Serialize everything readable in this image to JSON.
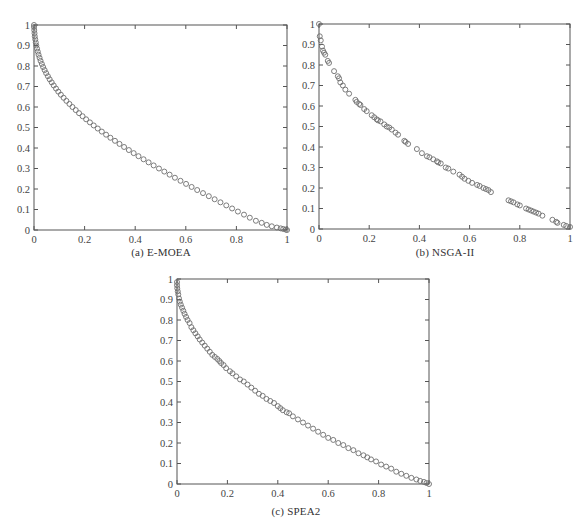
{
  "figure": {
    "panels": [
      {
        "id": "a",
        "caption": "(a) E-MOEA"
      },
      {
        "id": "b",
        "caption": "(b) NSGA-II"
      },
      {
        "id": "c",
        "caption": "(c) SPEA2"
      }
    ]
  },
  "style": {
    "marker_color": "#6e6e6e",
    "axis_color": "#555555",
    "marker": "hollow-circle"
  },
  "chart_data": [
    {
      "type": "scatter",
      "title": "(a) E-MOEA",
      "xlabel": "",
      "ylabel": "",
      "xlim": [
        0,
        1
      ],
      "ylim": [
        0,
        1
      ],
      "xticks": [
        "0",
        "0.2",
        "0.4",
        "0.6",
        "0.8",
        "1"
      ],
      "yticks": [
        "0",
        "0.1",
        "0.2",
        "0.3",
        "0.4",
        "0.5",
        "0.6",
        "0.7",
        "0.8",
        "0.9",
        "1"
      ],
      "grid": false,
      "legend": null,
      "series": [
        {
          "name": "E-MOEA",
          "points": [
            [
              0.0,
              1.0
            ],
            [
              0.0,
              0.99
            ],
            [
              0.001,
              0.975
            ],
            [
              0.002,
              0.96
            ],
            [
              0.003,
              0.945
            ],
            [
              0.005,
              0.93
            ],
            [
              0.007,
              0.915
            ],
            [
              0.009,
              0.9
            ],
            [
              0.012,
              0.885
            ],
            [
              0.015,
              0.87
            ],
            [
              0.018,
              0.855
            ],
            [
              0.022,
              0.84
            ],
            [
              0.026,
              0.825
            ],
            [
              0.031,
              0.81
            ],
            [
              0.036,
              0.795
            ],
            [
              0.042,
              0.78
            ],
            [
              0.048,
              0.765
            ],
            [
              0.055,
              0.75
            ],
            [
              0.062,
              0.735
            ],
            [
              0.07,
              0.72
            ],
            [
              0.078,
              0.705
            ],
            [
              0.087,
              0.69
            ],
            [
              0.096,
              0.675
            ],
            [
              0.106,
              0.66
            ],
            [
              0.117,
              0.645
            ],
            [
              0.128,
              0.63
            ],
            [
              0.14,
              0.615
            ],
            [
              0.152,
              0.6
            ],
            [
              0.165,
              0.585
            ],
            [
              0.178,
              0.57
            ],
            [
              0.192,
              0.555
            ],
            [
              0.206,
              0.54
            ],
            [
              0.221,
              0.525
            ],
            [
              0.236,
              0.51
            ],
            [
              0.252,
              0.495
            ],
            [
              0.268,
              0.48
            ],
            [
              0.285,
              0.465
            ],
            [
              0.302,
              0.45
            ],
            [
              0.32,
              0.435
            ],
            [
              0.338,
              0.42
            ],
            [
              0.356,
              0.405
            ],
            [
              0.375,
              0.39
            ],
            [
              0.394,
              0.375
            ],
            [
              0.413,
              0.36
            ],
            [
              0.433,
              0.345
            ],
            [
              0.453,
              0.33
            ],
            [
              0.473,
              0.315
            ],
            [
              0.494,
              0.3
            ],
            [
              0.515,
              0.285
            ],
            [
              0.536,
              0.27
            ],
            [
              0.557,
              0.255
            ],
            [
              0.579,
              0.24
            ],
            [
              0.601,
              0.225
            ],
            [
              0.623,
              0.21
            ],
            [
              0.645,
              0.195
            ],
            [
              0.668,
              0.18
            ],
            [
              0.691,
              0.165
            ],
            [
              0.714,
              0.15
            ],
            [
              0.737,
              0.135
            ],
            [
              0.76,
              0.12
            ],
            [
              0.783,
              0.105
            ],
            [
              0.806,
              0.09
            ],
            [
              0.83,
              0.075
            ],
            [
              0.853,
              0.06
            ],
            [
              0.877,
              0.045
            ],
            [
              0.9,
              0.035
            ],
            [
              0.92,
              0.025
            ],
            [
              0.94,
              0.018
            ],
            [
              0.96,
              0.012
            ],
            [
              0.975,
              0.008
            ],
            [
              0.985,
              0.005
            ],
            [
              0.995,
              0.002
            ],
            [
              1.0,
              0.0
            ]
          ]
        }
      ]
    },
    {
      "type": "scatter",
      "title": "(b) NSGA-II",
      "xlabel": "",
      "ylabel": "",
      "xlim": [
        0,
        1
      ],
      "ylim": [
        0,
        1
      ],
      "xticks": [
        "0",
        "0.2",
        "0.4",
        "0.6",
        "0.8",
        "1"
      ],
      "yticks": [
        "0",
        "0.1",
        "0.2",
        "0.3",
        "0.4",
        "0.5",
        "0.6",
        "0.7",
        "0.8",
        "0.9",
        "1"
      ],
      "grid": false,
      "legend": null,
      "series": [
        {
          "name": "NSGA-II",
          "points": [
            [
              0.0,
              1.0
            ],
            [
              0.003,
              0.94
            ],
            [
              0.007,
              0.92
            ],
            [
              0.012,
              0.89
            ],
            [
              0.016,
              0.87
            ],
            [
              0.02,
              0.86
            ],
            [
              0.025,
              0.85
            ],
            [
              0.035,
              0.82
            ],
            [
              0.04,
              0.81
            ],
            [
              0.06,
              0.77
            ],
            [
              0.075,
              0.745
            ],
            [
              0.08,
              0.735
            ],
            [
              0.085,
              0.715
            ],
            [
              0.095,
              0.7
            ],
            [
              0.105,
              0.68
            ],
            [
              0.12,
              0.66
            ],
            [
              0.145,
              0.63
            ],
            [
              0.15,
              0.62
            ],
            [
              0.16,
              0.61
            ],
            [
              0.165,
              0.605
            ],
            [
              0.18,
              0.585
            ],
            [
              0.19,
              0.575
            ],
            [
              0.21,
              0.555
            ],
            [
              0.22,
              0.545
            ],
            [
              0.23,
              0.535
            ],
            [
              0.235,
              0.53
            ],
            [
              0.245,
              0.525
            ],
            [
              0.26,
              0.51
            ],
            [
              0.27,
              0.5
            ],
            [
              0.28,
              0.495
            ],
            [
              0.29,
              0.485
            ],
            [
              0.305,
              0.47
            ],
            [
              0.315,
              0.46
            ],
            [
              0.34,
              0.43
            ],
            [
              0.345,
              0.425
            ],
            [
              0.355,
              0.415
            ],
            [
              0.39,
              0.39
            ],
            [
              0.41,
              0.37
            ],
            [
              0.43,
              0.355
            ],
            [
              0.44,
              0.35
            ],
            [
              0.455,
              0.34
            ],
            [
              0.47,
              0.33
            ],
            [
              0.475,
              0.325
            ],
            [
              0.485,
              0.32
            ],
            [
              0.505,
              0.3
            ],
            [
              0.515,
              0.295
            ],
            [
              0.535,
              0.28
            ],
            [
              0.56,
              0.265
            ],
            [
              0.57,
              0.255
            ],
            [
              0.58,
              0.245
            ],
            [
              0.595,
              0.235
            ],
            [
              0.61,
              0.225
            ],
            [
              0.63,
              0.215
            ],
            [
              0.64,
              0.21
            ],
            [
              0.655,
              0.2
            ],
            [
              0.665,
              0.195
            ],
            [
              0.675,
              0.19
            ],
            [
              0.685,
              0.18
            ],
            [
              0.755,
              0.14
            ],
            [
              0.765,
              0.135
            ],
            [
              0.775,
              0.13
            ],
            [
              0.79,
              0.12
            ],
            [
              0.8,
              0.115
            ],
            [
              0.825,
              0.1
            ],
            [
              0.835,
              0.095
            ],
            [
              0.845,
              0.09
            ],
            [
              0.855,
              0.085
            ],
            [
              0.865,
              0.08
            ],
            [
              0.875,
              0.075
            ],
            [
              0.89,
              0.065
            ],
            [
              0.93,
              0.045
            ],
            [
              0.945,
              0.035
            ],
            [
              0.95,
              0.03
            ],
            [
              0.975,
              0.02
            ],
            [
              0.985,
              0.015
            ],
            [
              1.0,
              0.01
            ]
          ]
        }
      ]
    },
    {
      "type": "scatter",
      "title": "(c) SPEA2",
      "xlabel": "",
      "ylabel": "",
      "xlim": [
        0,
        1
      ],
      "ylim": [
        0,
        1
      ],
      "xticks": [
        "0",
        "0.2",
        "0.4",
        "0.6",
        "0.8",
        "1"
      ],
      "yticks": [
        "0",
        "0.1",
        "0.2",
        "0.3",
        "0.4",
        "0.5",
        "0.6",
        "0.7",
        "0.8",
        "0.9",
        "1"
      ],
      "grid": false,
      "legend": null,
      "series": [
        {
          "name": "SPEA2",
          "points": [
            [
              0.0,
              0.985
            ],
            [
              0.0,
              0.97
            ],
            [
              0.001,
              0.955
            ],
            [
              0.003,
              0.94
            ],
            [
              0.005,
              0.925
            ],
            [
              0.008,
              0.905
            ],
            [
              0.011,
              0.89
            ],
            [
              0.015,
              0.875
            ],
            [
              0.02,
              0.86
            ],
            [
              0.025,
              0.845
            ],
            [
              0.03,
              0.83
            ],
            [
              0.036,
              0.815
            ],
            [
              0.042,
              0.8
            ],
            [
              0.05,
              0.785
            ],
            [
              0.057,
              0.765
            ],
            [
              0.065,
              0.75
            ],
            [
              0.073,
              0.735
            ],
            [
              0.082,
              0.72
            ],
            [
              0.09,
              0.705
            ],
            [
              0.1,
              0.69
            ],
            [
              0.11,
              0.675
            ],
            [
              0.12,
              0.66
            ],
            [
              0.13,
              0.645
            ],
            [
              0.14,
              0.63
            ],
            [
              0.15,
              0.62
            ],
            [
              0.16,
              0.61
            ],
            [
              0.168,
              0.6
            ],
            [
              0.175,
              0.59
            ],
            [
              0.185,
              0.58
            ],
            [
              0.195,
              0.565
            ],
            [
              0.21,
              0.55
            ],
            [
              0.22,
              0.54
            ],
            [
              0.235,
              0.525
            ],
            [
              0.25,
              0.51
            ],
            [
              0.265,
              0.5
            ],
            [
              0.28,
              0.485
            ],
            [
              0.295,
              0.47
            ],
            [
              0.31,
              0.455
            ],
            [
              0.325,
              0.44
            ],
            [
              0.34,
              0.43
            ],
            [
              0.355,
              0.415
            ],
            [
              0.37,
              0.405
            ],
            [
              0.385,
              0.395
            ],
            [
              0.4,
              0.38
            ],
            [
              0.41,
              0.37
            ],
            [
              0.42,
              0.36
            ],
            [
              0.435,
              0.35
            ],
            [
              0.445,
              0.345
            ],
            [
              0.46,
              0.33
            ],
            [
              0.48,
              0.315
            ],
            [
              0.5,
              0.3
            ],
            [
              0.52,
              0.285
            ],
            [
              0.54,
              0.27
            ],
            [
              0.56,
              0.255
            ],
            [
              0.58,
              0.24
            ],
            [
              0.6,
              0.225
            ],
            [
              0.62,
              0.215
            ],
            [
              0.64,
              0.2
            ],
            [
              0.66,
              0.19
            ],
            [
              0.68,
              0.175
            ],
            [
              0.7,
              0.165
            ],
            [
              0.72,
              0.15
            ],
            [
              0.74,
              0.14
            ],
            [
              0.755,
              0.13
            ],
            [
              0.77,
              0.12
            ],
            [
              0.79,
              0.11
            ],
            [
              0.81,
              0.095
            ],
            [
              0.83,
              0.085
            ],
            [
              0.85,
              0.075
            ],
            [
              0.87,
              0.06
            ],
            [
              0.89,
              0.05
            ],
            [
              0.91,
              0.04
            ],
            [
              0.93,
              0.03
            ],
            [
              0.95,
              0.022
            ],
            [
              0.965,
              0.015
            ],
            [
              0.98,
              0.01
            ],
            [
              0.99,
              0.005
            ],
            [
              1.0,
              0.0
            ]
          ]
        }
      ]
    }
  ]
}
